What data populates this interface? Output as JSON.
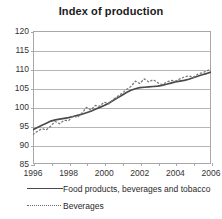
{
  "chart_data": {
    "type": "line",
    "title": "Index of production",
    "xlabel": "",
    "ylabel": "",
    "xlim": [
      1996,
      2006
    ],
    "ylim": [
      85,
      120
    ],
    "ytick_labels": [
      "120",
      "115",
      "110",
      "105",
      "100",
      "95",
      "90",
      "85"
    ],
    "ytick_values": [
      120,
      115,
      110,
      105,
      100,
      95,
      90,
      85
    ],
    "xtick_labels": [
      "1996",
      "1998",
      "2000",
      "2002",
      "2004",
      "2006"
    ],
    "xtick_values": [
      1996,
      1998,
      2000,
      2002,
      2004,
      2006
    ],
    "grid": true,
    "legend_position": "below",
    "series": [
      {
        "name": "Food products, beverages and tobacco",
        "style": "solid",
        "color": "#4a4a4a",
        "x": [
          1996.0,
          1996.25,
          1996.5,
          1996.75,
          1997.0,
          1997.25,
          1997.5,
          1997.75,
          1998.0,
          1998.25,
          1998.5,
          1998.75,
          1999.0,
          1999.25,
          1999.5,
          1999.75,
          2000.0,
          2000.25,
          2000.5,
          2000.75,
          2001.0,
          2001.25,
          2001.5,
          2001.75,
          2002.0,
          2002.25,
          2002.5,
          2002.75,
          2003.0,
          2003.25,
          2003.5,
          2003.75,
          2004.0,
          2004.25,
          2004.5,
          2004.75,
          2005.0,
          2005.25,
          2005.5,
          2005.75,
          2006.0
        ],
        "y": [
          94.0,
          94.6,
          95.2,
          95.7,
          96.3,
          96.6,
          96.8,
          97.0,
          97.2,
          97.5,
          97.8,
          98.1,
          98.5,
          98.9,
          99.4,
          99.9,
          100.4,
          101.0,
          101.7,
          102.4,
          103.1,
          103.8,
          104.4,
          104.8,
          105.1,
          105.2,
          105.3,
          105.4,
          105.5,
          105.7,
          106.0,
          106.3,
          106.6,
          106.8,
          107.0,
          107.3,
          107.7,
          108.1,
          108.5,
          108.8,
          109.2
        ]
      },
      {
        "name": "Beverages",
        "style": "dashed",
        "color": "#7a7a7a",
        "x": [
          1996.0,
          1996.25,
          1996.5,
          1996.75,
          1997.0,
          1997.25,
          1997.5,
          1997.75,
          1998.0,
          1998.25,
          1998.5,
          1998.75,
          1999.0,
          1999.25,
          1999.5,
          1999.75,
          2000.0,
          2000.25,
          2000.5,
          2000.75,
          2001.0,
          2001.25,
          2001.5,
          2001.75,
          2002.0,
          2002.25,
          2002.5,
          2002.75,
          2003.0,
          2003.25,
          2003.5,
          2003.75,
          2004.0,
          2004.25,
          2004.5,
          2004.75,
          2005.0,
          2005.25,
          2005.5,
          2005.75,
          2006.0
        ],
        "y": [
          92.8,
          93.6,
          94.3,
          94.0,
          95.0,
          96.2,
          95.6,
          96.5,
          96.4,
          97.6,
          97.3,
          98.4,
          99.9,
          99.2,
          100.4,
          100.2,
          101.3,
          100.8,
          102.0,
          102.8,
          103.6,
          104.6,
          105.4,
          106.8,
          106.2,
          107.4,
          106.6,
          107.2,
          106.4,
          105.9,
          106.5,
          107.0,
          106.8,
          107.4,
          107.9,
          108.2,
          107.8,
          108.6,
          109.0,
          109.4,
          110.1
        ]
      }
    ]
  },
  "legend": [
    {
      "label": "Food products, beverages and tobacco",
      "style": "solid"
    },
    {
      "label": "Beverages",
      "style": "dashed"
    }
  ]
}
